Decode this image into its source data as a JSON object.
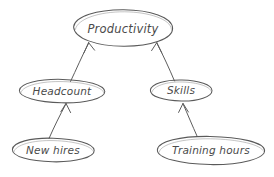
{
  "diagram": {
    "style": "hand-drawn sketch",
    "background_color": "#ffffff",
    "stroke_color": "#5a5a5a",
    "text_color": "#4a4a4a",
    "nodes": [
      {
        "id": "productivity",
        "label": "Productivity",
        "cx": 123,
        "cy": 28,
        "rx": 50,
        "ry": 18,
        "font_size": 11.5
      },
      {
        "id": "headcount",
        "label": "Headcount",
        "cx": 62,
        "cy": 91,
        "rx": 43,
        "ry": 12,
        "font_size": 10.5
      },
      {
        "id": "skills",
        "label": "Skills",
        "cx": 181,
        "cy": 91,
        "rx": 31,
        "ry": 11,
        "font_size": 10.5
      },
      {
        "id": "new-hires",
        "label": "New hires",
        "cx": 53,
        "cy": 150,
        "rx": 41,
        "ry": 12,
        "font_size": 10.5
      },
      {
        "id": "training-hours",
        "label": "Training hours",
        "cx": 211,
        "cy": 150,
        "rx": 54,
        "ry": 14,
        "font_size": 10.5
      }
    ],
    "edges": [
      {
        "id": "headcount-to-productivity",
        "from": "headcount",
        "to": "productivity",
        "label": "",
        "x1": 70,
        "y1": 81,
        "x2": 89,
        "y2": 43
      },
      {
        "id": "skills-to-productivity",
        "from": "skills",
        "to": "productivity",
        "label": "",
        "x1": 174,
        "y1": 81,
        "x2": 156,
        "y2": 43
      },
      {
        "id": "new-hires-to-headcount",
        "from": "new-hires",
        "to": "headcount",
        "label": "",
        "x1": 49,
        "y1": 138,
        "x2": 66,
        "y2": 104
      },
      {
        "id": "training-hours-to-skills",
        "from": "training-hours",
        "to": "skills",
        "label": "",
        "x1": 197,
        "y1": 136,
        "x2": 183,
        "y2": 104
      }
    ]
  }
}
